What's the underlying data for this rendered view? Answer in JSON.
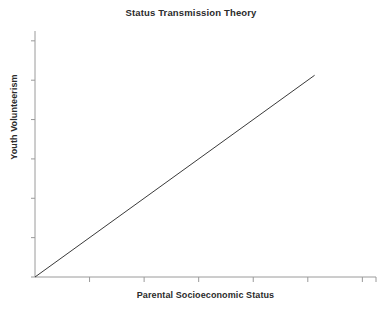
{
  "chart_data": {
    "type": "line",
    "title": "Status Transmission Theory",
    "xlabel": "Parental Socioeconomic Status",
    "ylabel": "Youth Volunteerism",
    "grid": false,
    "legend": null,
    "xlim": [
      0,
      10
    ],
    "ylim": [
      0,
      10
    ],
    "x_tick_labels": [],
    "y_tick_labels": [],
    "x_ticks": [
      0,
      1.6,
      3.2,
      4.8,
      6.4,
      8.0,
      9.6,
      10
    ],
    "y_ticks": [
      0,
      1.6,
      3.2,
      4.8,
      6.4,
      8.0,
      9.6
    ],
    "series": [
      {
        "name": "Status transmission",
        "color": "#3a3a3a",
        "x": [
          0,
          8.2
        ],
        "y": [
          0,
          8.2
        ]
      }
    ],
    "annotations": []
  },
  "axes": {
    "line_color": "#9a9a9a",
    "tick_color": "#9a9a9a",
    "data_line_color": "#3a3a3a",
    "background": "#ffffff"
  },
  "artifact": {
    "bottom_text": ""
  }
}
